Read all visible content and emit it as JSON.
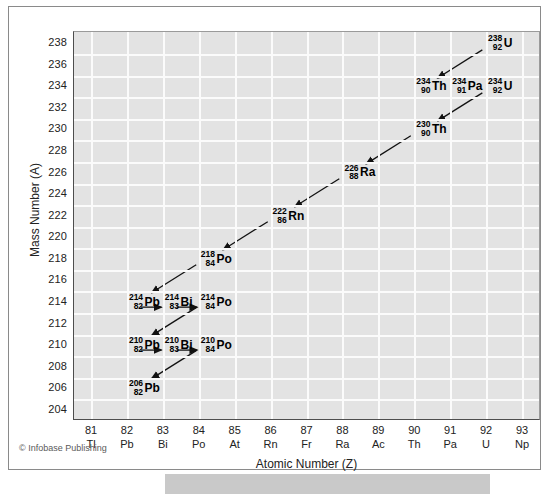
{
  "figure": {
    "credit": "© Infobase Publishing",
    "yaxis_title": "Mass Number (A)",
    "xaxis_title": "Atomic Number (Z)"
  },
  "chart_data": {
    "type": "scatter",
    "title": "",
    "xlabel": "Atomic Number (Z)",
    "ylabel": "Mass Number (A)",
    "xlim": [
      81,
      93
    ],
    "ylim": [
      204,
      238
    ],
    "grid": true,
    "legend": "none",
    "x_ticks": [
      {
        "num": "81",
        "sym": "Tl"
      },
      {
        "num": "82",
        "sym": "Pb"
      },
      {
        "num": "83",
        "sym": "Bi"
      },
      {
        "num": "84",
        "sym": "Po"
      },
      {
        "num": "85",
        "sym": "At"
      },
      {
        "num": "86",
        "sym": "Rn"
      },
      {
        "num": "87",
        "sym": "Fr"
      },
      {
        "num": "88",
        "sym": "Ra"
      },
      {
        "num": "89",
        "sym": "Ac"
      },
      {
        "num": "90",
        "sym": "Th"
      },
      {
        "num": "91",
        "sym": "Pa"
      },
      {
        "num": "92",
        "sym": "U"
      },
      {
        "num": "93",
        "sym": "Np"
      }
    ],
    "y_ticks": [
      "238",
      "236",
      "234",
      "232",
      "230",
      "228",
      "226",
      "224",
      "222",
      "220",
      "218",
      "216",
      "214",
      "212",
      "210",
      "208",
      "206",
      "204"
    ],
    "points": [
      {
        "mass": "238",
        "z": "92",
        "sym": "U",
        "x": 92,
        "y": 238
      },
      {
        "mass": "234",
        "z": "90",
        "sym": "Th",
        "x": 90,
        "y": 234
      },
      {
        "mass": "234",
        "z": "91",
        "sym": "Pa",
        "x": 91,
        "y": 234
      },
      {
        "mass": "234",
        "z": "92",
        "sym": "U",
        "x": 92,
        "y": 234
      },
      {
        "mass": "230",
        "z": "90",
        "sym": "Th",
        "x": 90,
        "y": 230
      },
      {
        "mass": "226",
        "z": "88",
        "sym": "Ra",
        "x": 88,
        "y": 226
      },
      {
        "mass": "222",
        "z": "86",
        "sym": "Rn",
        "x": 86,
        "y": 222
      },
      {
        "mass": "218",
        "z": "84",
        "sym": "Po",
        "x": 84,
        "y": 218
      },
      {
        "mass": "214",
        "z": "82",
        "sym": "Pb",
        "x": 82,
        "y": 214
      },
      {
        "mass": "214",
        "z": "83",
        "sym": "Bi",
        "x": 83,
        "y": 214
      },
      {
        "mass": "214",
        "z": "84",
        "sym": "Po",
        "x": 84,
        "y": 214
      },
      {
        "mass": "210",
        "z": "82",
        "sym": "Pb",
        "x": 82,
        "y": 210
      },
      {
        "mass": "210",
        "z": "83",
        "sym": "Bi",
        "x": 83,
        "y": 210
      },
      {
        "mass": "210",
        "z": "84",
        "sym": "Po",
        "x": 84,
        "y": 210
      },
      {
        "mass": "206",
        "z": "82",
        "sym": "Pb",
        "x": 82,
        "y": 206
      }
    ],
    "decays": [
      {
        "from": [
          92,
          238
        ],
        "to": [
          90,
          234
        ],
        "kind": "alpha"
      },
      {
        "from": [
          92,
          234
        ],
        "to": [
          90,
          230
        ],
        "kind": "alpha"
      },
      {
        "from": [
          90,
          230
        ],
        "to": [
          88,
          226
        ],
        "kind": "alpha"
      },
      {
        "from": [
          88,
          226
        ],
        "to": [
          86,
          222
        ],
        "kind": "alpha"
      },
      {
        "from": [
          86,
          222
        ],
        "to": [
          84,
          218
        ],
        "kind": "alpha"
      },
      {
        "from": [
          84,
          218
        ],
        "to": [
          82,
          214
        ],
        "kind": "alpha"
      },
      {
        "from": [
          82,
          214
        ],
        "to": [
          83,
          214
        ],
        "kind": "beta"
      },
      {
        "from": [
          83,
          214
        ],
        "to": [
          84,
          214
        ],
        "kind": "beta"
      },
      {
        "from": [
          84,
          214
        ],
        "to": [
          82,
          210
        ],
        "kind": "alpha"
      },
      {
        "from": [
          82,
          210
        ],
        "to": [
          83,
          210
        ],
        "kind": "beta"
      },
      {
        "from": [
          83,
          210
        ],
        "to": [
          84,
          210
        ],
        "kind": "beta"
      },
      {
        "from": [
          84,
          210
        ],
        "to": [
          82,
          206
        ],
        "kind": "alpha"
      }
    ]
  }
}
